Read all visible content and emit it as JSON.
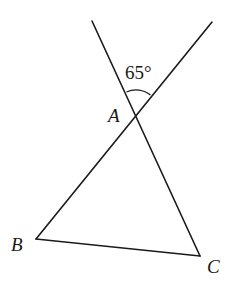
{
  "figure": {
    "type": "geometry",
    "points": {
      "A": {
        "label": "A",
        "x": 136,
        "y": 113
      },
      "B": {
        "label": "B",
        "x": 36,
        "y": 239
      },
      "C": {
        "label": "C",
        "x": 200,
        "y": 256
      }
    },
    "extensions": {
      "from_C_through_A_end": {
        "x": 92,
        "y": 21
      },
      "from_B_through_A_end": {
        "x": 212,
        "y": 22
      }
    },
    "angle": {
      "vertex": "A",
      "label": "65°",
      "value_degrees": 65
    },
    "labels": {
      "A": "A",
      "B": "B",
      "C": "C",
      "angle": "65°"
    }
  }
}
